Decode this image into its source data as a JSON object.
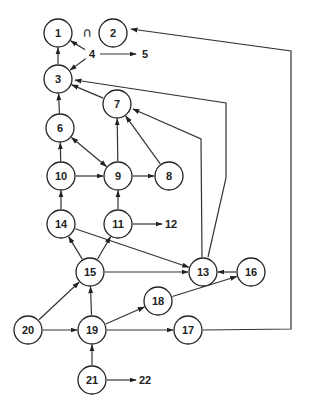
{
  "diagram": {
    "type": "directed-graph",
    "symbol": "∩",
    "nodes": [
      {
        "id": "1",
        "label": "1",
        "x": 58,
        "y": 33,
        "circled": true
      },
      {
        "id": "2",
        "label": "2",
        "x": 113,
        "y": 33,
        "circled": true
      },
      {
        "id": "3",
        "label": "3",
        "x": 58,
        "y": 79,
        "circled": true
      },
      {
        "id": "4",
        "label": "4",
        "x": 92,
        "y": 54,
        "circled": false
      },
      {
        "id": "5",
        "label": "5",
        "x": 145,
        "y": 54,
        "circled": false
      },
      {
        "id": "6",
        "label": "6",
        "x": 60,
        "y": 128,
        "circled": true
      },
      {
        "id": "7",
        "label": "7",
        "x": 117,
        "y": 104,
        "circled": true
      },
      {
        "id": "8",
        "label": "8",
        "x": 169,
        "y": 176,
        "circled": true
      },
      {
        "id": "9",
        "label": "9",
        "x": 118,
        "y": 176,
        "circled": true
      },
      {
        "id": "10",
        "label": "10",
        "x": 61,
        "y": 176,
        "circled": true
      },
      {
        "id": "11",
        "label": "11",
        "x": 118,
        "y": 224,
        "circled": true
      },
      {
        "id": "12",
        "label": "12",
        "x": 171,
        "y": 224,
        "circled": false
      },
      {
        "id": "13",
        "label": "13",
        "x": 203,
        "y": 272,
        "circled": true
      },
      {
        "id": "14",
        "label": "14",
        "x": 61,
        "y": 224,
        "circled": true
      },
      {
        "id": "15",
        "label": "15",
        "x": 90,
        "y": 272,
        "circled": true
      },
      {
        "id": "16",
        "label": "16",
        "x": 251,
        "y": 272,
        "circled": true
      },
      {
        "id": "17",
        "label": "17",
        "x": 188,
        "y": 330,
        "circled": true
      },
      {
        "id": "18",
        "label": "18",
        "x": 158,
        "y": 301,
        "circled": true
      },
      {
        "id": "19",
        "label": "19",
        "x": 92,
        "y": 330,
        "circled": true
      },
      {
        "id": "20",
        "label": "20",
        "x": 28,
        "y": 330,
        "circled": true
      },
      {
        "id": "21",
        "label": "21",
        "x": 92,
        "y": 380,
        "circled": true
      },
      {
        "id": "22",
        "label": "22",
        "x": 145,
        "y": 380,
        "circled": false
      }
    ],
    "edges": [
      {
        "from": "3",
        "to": "1"
      },
      {
        "from": "4",
        "to": "1"
      },
      {
        "from": "4",
        "to": "3"
      },
      {
        "from": "4",
        "to": "5"
      },
      {
        "from": "6",
        "to": "3"
      },
      {
        "from": "7",
        "to": "3"
      },
      {
        "from": "6",
        "to": "9",
        "bidirectional": true
      },
      {
        "from": "9",
        "to": "7"
      },
      {
        "from": "8",
        "to": "7"
      },
      {
        "from": "9",
        "to": "8"
      },
      {
        "from": "10",
        "to": "6"
      },
      {
        "from": "10",
        "to": "9"
      },
      {
        "from": "14",
        "to": "10"
      },
      {
        "from": "11",
        "to": "9"
      },
      {
        "from": "11",
        "to": "12"
      },
      {
        "from": "14",
        "to": "13"
      },
      {
        "from": "15",
        "to": "14"
      },
      {
        "from": "15",
        "to": "11"
      },
      {
        "from": "15",
        "to": "13"
      },
      {
        "from": "13",
        "to": "7"
      },
      {
        "from": "13",
        "to": "3"
      },
      {
        "from": "16",
        "to": "13"
      },
      {
        "from": "18",
        "to": "16"
      },
      {
        "from": "19",
        "to": "15"
      },
      {
        "from": "19",
        "to": "18"
      },
      {
        "from": "19",
        "to": "17"
      },
      {
        "from": "17",
        "to": "2"
      },
      {
        "from": "20",
        "to": "15"
      },
      {
        "from": "20",
        "to": "19"
      },
      {
        "from": "21",
        "to": "19"
      },
      {
        "from": "21",
        "to": "22"
      }
    ]
  }
}
